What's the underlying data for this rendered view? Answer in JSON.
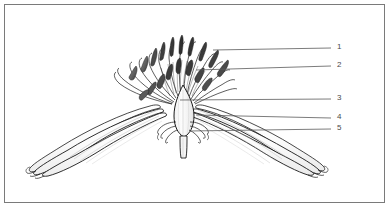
{
  "figure": {
    "kind": "botanical-line-drawing",
    "frame_color": "#7a7a7a",
    "background_color": "#ffffff",
    "ink_color": "#1a1a1a",
    "shading_color": "#6d6d6d",
    "callout_line_color": "#5a5a5a"
  },
  "callouts": [
    {
      "number": "1",
      "num_x": 337,
      "num_y": 43,
      "line_x1": 213,
      "line_y1": 50,
      "line_x2": 331,
      "line_y2": 48
    },
    {
      "number": "2",
      "num_x": 337,
      "num_y": 61,
      "line_x1": 196,
      "line_y1": 70,
      "line_x2": 331,
      "line_y2": 66
    },
    {
      "number": "3",
      "num_x": 337,
      "num_y": 94,
      "line_x1": 180,
      "line_y1": 100,
      "line_x2": 331,
      "line_y2": 99
    },
    {
      "number": "4",
      "num_x": 337,
      "num_y": 113,
      "line_x1": 196,
      "line_y1": 115,
      "line_x2": 331,
      "line_y2": 118
    },
    {
      "number": "5",
      "num_x": 337,
      "num_y": 124,
      "line_x1": 189,
      "line_y1": 131,
      "line_x2": 331,
      "line_y2": 129
    }
  ],
  "parts": {
    "stamens_label": "stamens",
    "anthers_label": "anthers",
    "ovary_label": "ovary",
    "petal_left_label": "left petal",
    "petal_right_label": "right petal",
    "bracts_label": "bracts",
    "pedicel_label": "pedicel"
  }
}
